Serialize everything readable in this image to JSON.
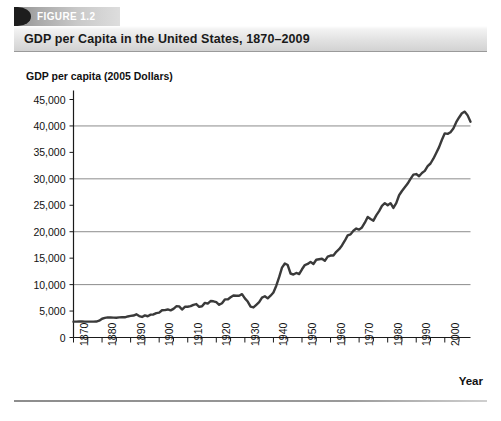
{
  "figure": {
    "number_label": "FIGURE 1.2",
    "title": "GDP per Capita in the United States, 1870–2009"
  },
  "chart_data": {
    "type": "line",
    "title": "GDP per Capita in the United States, 1870–2009",
    "xlabel": "Year",
    "ylabel": "GDP per capita (2005 Dollars)",
    "xlim": [
      1870,
      2009
    ],
    "ylim": [
      0,
      45000
    ],
    "grid": "horizontal gridlines at 10000, 20000, 30000 and 40000",
    "gridlines": [
      10000,
      20000,
      30000,
      40000
    ],
    "legend": "none",
    "line_color": "#3a3a3a",
    "y_ticks": [
      0,
      5000,
      10000,
      15000,
      20000,
      25000,
      30000,
      35000,
      40000,
      45000
    ],
    "y_tick_labels": [
      "0",
      "5,000",
      "10,000",
      "15,000",
      "20,000",
      "25,000",
      "30,000",
      "35,000",
      "40,000",
      "45,000"
    ],
    "x_ticks": [
      1870,
      1880,
      1890,
      1900,
      1910,
      1920,
      1930,
      1940,
      1950,
      1960,
      1970,
      1980,
      1990,
      2000
    ],
    "x_tick_labels": [
      "1870",
      "1880",
      "1890",
      "1900",
      "1910",
      "1920",
      "1930",
      "1940",
      "1950",
      "1960",
      "1970",
      "1980",
      "1990",
      "2000"
    ],
    "x_minor_tick_interval": 5,
    "series": [
      {
        "name": "GDP per capita (2005 Dollars)",
        "x": [
          1870,
          1871,
          1872,
          1873,
          1874,
          1875,
          1876,
          1877,
          1878,
          1879,
          1880,
          1881,
          1882,
          1883,
          1884,
          1885,
          1886,
          1887,
          1888,
          1889,
          1890,
          1891,
          1892,
          1893,
          1894,
          1895,
          1896,
          1897,
          1898,
          1899,
          1900,
          1901,
          1902,
          1903,
          1904,
          1905,
          1906,
          1907,
          1908,
          1909,
          1910,
          1911,
          1912,
          1913,
          1914,
          1915,
          1916,
          1917,
          1918,
          1919,
          1920,
          1921,
          1922,
          1923,
          1924,
          1925,
          1926,
          1927,
          1928,
          1929,
          1930,
          1931,
          1932,
          1933,
          1934,
          1935,
          1936,
          1937,
          1938,
          1939,
          1940,
          1941,
          1942,
          1943,
          1944,
          1945,
          1946,
          1947,
          1948,
          1949,
          1950,
          1951,
          1952,
          1953,
          1954,
          1955,
          1956,
          1957,
          1958,
          1959,
          1960,
          1961,
          1962,
          1963,
          1964,
          1965,
          1966,
          1967,
          1968,
          1969,
          1970,
          1971,
          1972,
          1973,
          1974,
          1975,
          1976,
          1977,
          1978,
          1979,
          1980,
          1981,
          1982,
          1983,
          1984,
          1985,
          1986,
          1987,
          1988,
          1989,
          1990,
          1991,
          1992,
          1993,
          1994,
          1995,
          1996,
          1997,
          1998,
          1999,
          2000,
          2001,
          2002,
          2003,
          2004,
          2005,
          2006,
          2007,
          2008,
          2009
        ],
        "values": [
          3000,
          3000,
          3020,
          3030,
          3010,
          3000,
          3000,
          3010,
          3020,
          3180,
          3550,
          3700,
          3800,
          3780,
          3760,
          3740,
          3800,
          3860,
          3820,
          3980,
          4080,
          4150,
          4380,
          4050,
          3880,
          4180,
          4020,
          4320,
          4360,
          4620,
          4700,
          5150,
          5180,
          5300,
          5120,
          5420,
          5900,
          5880,
          5280,
          5800,
          5820,
          5920,
          6180,
          6320,
          5800,
          5900,
          6550,
          6400,
          6900,
          6850,
          6680,
          6180,
          6480,
          7200,
          7200,
          7600,
          7950,
          7900,
          7900,
          8200,
          7400,
          6800,
          5850,
          5680,
          6180,
          6700,
          7550,
          7800,
          7400,
          7900,
          8500,
          9800,
          11400,
          13200,
          14000,
          13700,
          12100,
          11900,
          12200,
          12000,
          12900,
          13700,
          13900,
          14300,
          13900,
          14700,
          14800,
          14900,
          14500,
          15300,
          15500,
          15500,
          16200,
          16700,
          17400,
          18300,
          19300,
          19500,
          20200,
          20600,
          20400,
          20800,
          21700,
          22800,
          22400,
          22100,
          23100,
          23900,
          24900,
          25400,
          25000,
          25400,
          24500,
          25400,
          26900,
          27700,
          28400,
          29100,
          30000,
          30800,
          30900,
          30500,
          31100,
          31500,
          32400,
          32900,
          33800,
          34900,
          36000,
          37400,
          38600,
          38500,
          38800,
          39500,
          40700,
          41600,
          42400,
          42700,
          42000,
          40800
        ]
      }
    ],
    "annotations": [
      "Great Depression trough near 1933 at about 5,700",
      "World War II peak near 1944 at about 14,000 with postwar dip",
      "Peak near 2007 at about 42,700 followed by decline to about 40,800 in 2009"
    ]
  }
}
